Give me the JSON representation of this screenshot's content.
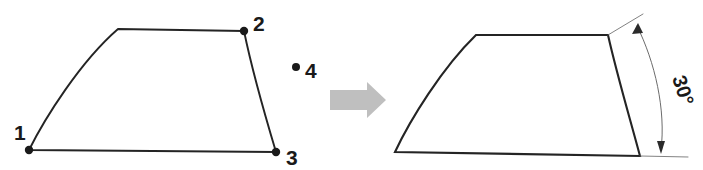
{
  "figure": {
    "canvas": {
      "width": 703,
      "height": 170,
      "background": "#ffffff"
    },
    "colors": {
      "outline": "#242424",
      "vertex_dot": "#1a1a1a",
      "label_text": "#1a1a1a",
      "dimension_line": "#5a5a5a",
      "transform_arrow": "#bfbfbf"
    }
  },
  "left_shape": {
    "name": "original-quadrilateral",
    "labels": [
      {
        "id": "vertex-1",
        "text": "1",
        "x": 14,
        "y": 137,
        "dot_x": 29,
        "dot_y": 150
      },
      {
        "id": "vertex-2",
        "text": "2",
        "x": 253,
        "y": 30,
        "dot_x": 244,
        "dot_y": 31
      },
      {
        "id": "vertex-3",
        "text": "3",
        "x": 286,
        "y": 162,
        "dot_x": 276,
        "dot_y": 152
      },
      {
        "id": "vertex-4",
        "text": "4",
        "x": 305,
        "y": 77,
        "dot_x": 296,
        "dot_y": 67
      }
    ],
    "outline_path": "M 29 150 C 45 118 80 62 118 29 L 244 31 C 252 70 264 112 276 152 L 29 150 Z",
    "vertex_count": 4
  },
  "transform_arrow": {
    "name": "transform-arrow",
    "direction": "right",
    "x": 330,
    "y": 82,
    "width": 56,
    "height": 36,
    "color": "#bfbfbf"
  },
  "right_shape": {
    "name": "rotated-quadrilateral",
    "outline_path": "M 395 152 C 410 120 442 68 476 35 L 608 35 C 617 75 629 115 640 156 L 395 152 Z",
    "annotation": {
      "name": "angle-dimension",
      "text": "30°",
      "value": 30,
      "unit": "degrees",
      "label_x": 672,
      "label_y": 78,
      "label_rotation": 72,
      "arc_path": "M 637 26 C 655 62 666 110 661 150",
      "ext_line_upper": "M 608 35 L 643 14",
      "ext_line_lower": "M 640 156 L 688 157",
      "arrow_top": {
        "x": 639,
        "y": 24,
        "angle": 208
      },
      "arrow_bottom": {
        "x": 661,
        "y": 152,
        "angle": 84
      }
    }
  }
}
